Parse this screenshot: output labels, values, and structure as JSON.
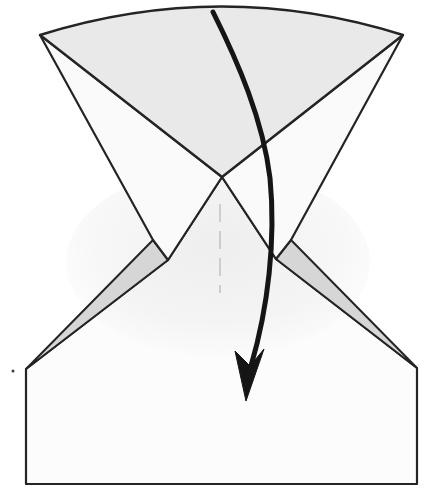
{
  "figure": {
    "kind": "origami-fold-step-diagram",
    "canvas": {
      "width": 433,
      "height": 497
    },
    "palette": {
      "background": "#ffffff",
      "paper_white": "#fcfcfc",
      "wing_white": "#fafafa",
      "fan_gray": "#e9e9e9",
      "flap_gray": "#d6d6d6",
      "outline": "#242424",
      "arrow_black": "#151515",
      "crease_gray": "#bfbfbf",
      "shading_tint": "rgba(0,0,0,0.055)"
    },
    "landmarks": {
      "top_left_corner": [
        40,
        35
      ],
      "top_right_corner": [
        403,
        35
      ],
      "center_vertex": [
        222,
        177
      ],
      "paper_left_corner": [
        26,
        369
      ],
      "paper_right_corner": [
        417,
        368
      ],
      "paper_bottom_left": [
        26,
        484
      ],
      "paper_bottom_right": [
        417,
        484
      ],
      "arrow_start": [
        213,
        12
      ],
      "arrow_tip": [
        246,
        401
      ]
    },
    "shapes": [
      {
        "name": "paper-base",
        "type": "path",
        "d": "M26,369 L168,260 L222,177 L276,259 L417,368 L417,484 L26,484 Z",
        "fill": "#fcfcfc",
        "stroke": "#242424",
        "width": 2.2
      },
      {
        "name": "paper-shading",
        "type": "ellipse",
        "cx": 218,
        "cy": 262,
        "rx": 152,
        "ry": 94,
        "fill": "url(#wash)"
      },
      {
        "name": "center-crease",
        "type": "line",
        "x1": 220,
        "y1": 204,
        "x2": 220,
        "y2": 293,
        "stroke": "#bfbfbf",
        "width": 1.4,
        "dash": "18 9"
      },
      {
        "name": "left-flap",
        "type": "path",
        "d": "M153,240 L168,260 L26,369 Z",
        "fill": "#d6d6d6",
        "stroke": "#242424",
        "width": 2
      },
      {
        "name": "right-flap",
        "type": "path",
        "d": "M291,240 L276,259 L417,368 Z",
        "fill": "#d6d6d6",
        "stroke": "#242424",
        "width": 2
      },
      {
        "name": "fan-left-wing",
        "type": "path",
        "d": "M40,35 L222,177 L168,260 L153,240 Z",
        "fill": "#fafafa",
        "stroke": "#242424",
        "width": 2.2
      },
      {
        "name": "fan-right-wing",
        "type": "path",
        "d": "M403,35 L222,177 L276,259 L291,240 Z",
        "fill": "#fafafa",
        "stroke": "#242424",
        "width": 2.2
      },
      {
        "name": "fan-center",
        "type": "path",
        "d": "M40,35 Q222,-22 403,35 L222,177 Z",
        "fill": "#e9e9e9",
        "stroke": "#242424",
        "width": 2.4
      },
      {
        "name": "fold-arrow-shaft",
        "type": "path",
        "d": "M213,12 C238,62 263,120 270,178 C276,240 268,308 251,366",
        "fill": "none",
        "stroke": "#151515",
        "width": 5,
        "cap": "round"
      },
      {
        "name": "fold-arrow-head",
        "type": "path",
        "d": "M246,401 L235,351 L250,366 L264,349 Z",
        "fill": "#151515",
        "stroke": "#151515",
        "width": 1
      },
      {
        "name": "print-speck",
        "type": "circle",
        "cx": 13,
        "cy": 371,
        "r": 1.5,
        "fill": "#3a3a3a"
      }
    ]
  }
}
